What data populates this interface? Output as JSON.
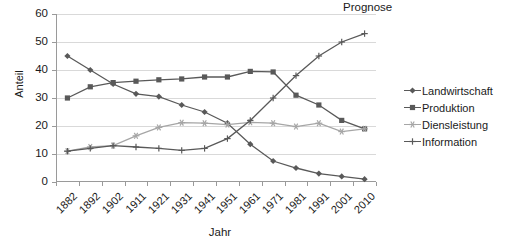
{
  "chart_data": {
    "type": "line",
    "title": "",
    "xlabel": "Jahr",
    "ylabel": "Anteil",
    "ylim": [
      0,
      60
    ],
    "ytick_step": 10,
    "yticks": [
      "60",
      "50",
      "40",
      "30",
      "20",
      "10",
      "0"
    ],
    "grid": "horizontal",
    "legend_position": "right",
    "annotations": [
      {
        "text": "Prognose",
        "position": "top-right"
      }
    ],
    "categories": [
      "1882",
      "1892",
      "1902",
      "1911",
      "1921",
      "1931",
      "1941",
      "1951",
      "1961",
      "1971",
      "1981",
      "1991",
      "2001",
      "2010"
    ],
    "series": [
      {
        "name": "Landwirtschaft",
        "color": "#595959",
        "marker": "diamond",
        "values": [
          45,
          40,
          35,
          31.5,
          30.5,
          27.5,
          25,
          21,
          13.5,
          7.5,
          5,
          3,
          2,
          1
        ]
      },
      {
        "name": "Produktion",
        "color": "#595959",
        "marker": "square",
        "values": [
          30,
          34,
          35.5,
          36,
          36.5,
          36.8,
          37.5,
          37.5,
          39.5,
          39.3,
          31,
          27.5,
          22,
          19
        ]
      },
      {
        "name": "Diensleistung",
        "color": "#a6a6a6",
        "marker": "star",
        "values": [
          11,
          12.5,
          13,
          16.5,
          19.5,
          21.2,
          21,
          20.5,
          21.3,
          21,
          19.8,
          21,
          18,
          19
        ]
      },
      {
        "name": "Information",
        "color": "#595959",
        "marker": "plus",
        "values": [
          11,
          12,
          13,
          12.5,
          12,
          11.3,
          12,
          15.5,
          22,
          30,
          38,
          45,
          50,
          53
        ]
      }
    ]
  },
  "legend": {
    "items": [
      {
        "label": "Landwirtschaft"
      },
      {
        "label": "Produktion"
      },
      {
        "label": "Diensleistung"
      },
      {
        "label": "Information"
      }
    ]
  },
  "colors": {
    "dark_series": "#595959",
    "light_series": "#a6a6a6",
    "gridline": "#d9d9d9",
    "axis": "#9a9a9a",
    "text": "#1a1a1a",
    "background": "#ffffff"
  }
}
